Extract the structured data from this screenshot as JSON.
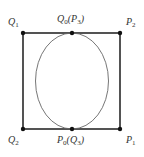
{
  "diagram": {
    "square": {
      "stroke": "#2a2a2a",
      "corners": {
        "top_left": [
          23,
          33
        ],
        "top_right": [
          120,
          33
        ],
        "bottom_right": [
          120,
          129
        ],
        "bottom_left": [
          23,
          129
        ]
      }
    },
    "ellipse": {
      "stroke": "#666666",
      "center": [
        72,
        81
      ],
      "rx": 36.5,
      "ry": 48
    },
    "points": [
      {
        "id": "Q1",
        "pos": [
          23,
          33
        ]
      },
      {
        "id": "Q0(P3)",
        "pos": [
          72,
          33
        ]
      },
      {
        "id": "P2",
        "pos": [
          120,
          33
        ]
      },
      {
        "id": "Q2",
        "pos": [
          23,
          129
        ]
      },
      {
        "id": "P0(Q3)",
        "pos": [
          72,
          129
        ]
      },
      {
        "id": "P1",
        "pos": [
          120,
          129
        ]
      }
    ],
    "labels": {
      "q1": {
        "main": "Q",
        "sub": "1"
      },
      "q0p3": {
        "main": "Q",
        "sub": "0",
        "paren_main": "P",
        "paren_sub": "3"
      },
      "p2": {
        "main": "P",
        "sub": "2"
      },
      "q2": {
        "main": "Q",
        "sub": "2"
      },
      "p0q3": {
        "main": "P",
        "sub": "0",
        "paren_main": "Q",
        "paren_sub": "3"
      },
      "p1": {
        "main": "P",
        "sub": "1"
      }
    }
  }
}
